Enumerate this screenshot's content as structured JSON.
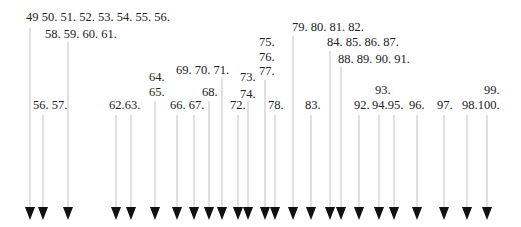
{
  "diagram": {
    "type": "arrow-index",
    "colors": {
      "line": "#cccccc",
      "arrowhead": "#111111",
      "text": "#222222"
    },
    "labels": [
      {
        "id": "l1",
        "text": "49 50. 51. 52. 53. 54. 55. 56."
      },
      {
        "id": "l2",
        "text": "58. 59. 60. 61."
      },
      {
        "id": "l3",
        "text": "56. 57."
      },
      {
        "id": "l4",
        "text": "62.63."
      },
      {
        "id": "l5",
        "text": "64."
      },
      {
        "id": "l6",
        "text": "65."
      },
      {
        "id": "l7",
        "text": "66. 67."
      },
      {
        "id": "l8",
        "text": "69. 70. 71."
      },
      {
        "id": "l9",
        "text": "68."
      },
      {
        "id": "l10",
        "text": "72."
      },
      {
        "id": "l11",
        "text": "73."
      },
      {
        "id": "l12",
        "text": "74."
      },
      {
        "id": "l13",
        "text": "75."
      },
      {
        "id": "l14",
        "text": "76."
      },
      {
        "id": "l15",
        "text": "77."
      },
      {
        "id": "l16",
        "text": "78."
      },
      {
        "id": "l17",
        "text": "79. 80. 81. 82."
      },
      {
        "id": "l18",
        "text": "84. 85. 86. 87."
      },
      {
        "id": "l19",
        "text": "88. 89. 90. 91."
      },
      {
        "id": "l20",
        "text": "83."
      },
      {
        "id": "l21",
        "text": "92."
      },
      {
        "id": "l22",
        "text": "93."
      },
      {
        "id": "l23",
        "text": "94.95."
      },
      {
        "id": "l24",
        "text": "96."
      },
      {
        "id": "l25",
        "text": "97."
      },
      {
        "id": "l26",
        "text": "98.100."
      },
      {
        "id": "l27",
        "text": "99."
      }
    ],
    "arrow_count": 25
  }
}
